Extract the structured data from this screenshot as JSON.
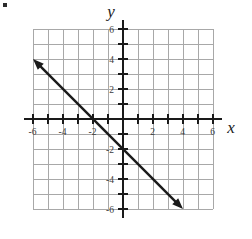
{
  "figure": {
    "name": "coordinate-plane-with-line",
    "background_color": "#ffffff",
    "width": 252,
    "height": 239
  },
  "axis_labels": {
    "x": "x",
    "y": "y"
  },
  "colors": {
    "grid": "#a8a8a8",
    "axis": "#1a1a1a",
    "line": "#1a1a1a",
    "tick_label": "#3a3a3a"
  },
  "chart_data": {
    "type": "line",
    "title": "",
    "xlabel": "x",
    "ylabel": "y",
    "xlim": [
      -6,
      6
    ],
    "ylim": [
      -6,
      6
    ],
    "grid": true,
    "legend": "none",
    "x_tick_values": [
      -6,
      -4,
      -2,
      2,
      4,
      6
    ],
    "y_tick_values": [
      6,
      4,
      2,
      -2,
      -4,
      -6
    ],
    "x_tick_labels": [
      "-6",
      "-4",
      "-2",
      "2",
      "4",
      "6"
    ],
    "y_tick_labels": [
      "6",
      "4",
      "2",
      "-2",
      "-4",
      "-6"
    ],
    "minor_tick_step": 1,
    "series": [
      {
        "name": "line",
        "equation": "y = -x - 2",
        "slope": -1,
        "y_intercept": -2,
        "x_intercept": -2,
        "arrows": "both",
        "endpoints": [
          {
            "x": -6,
            "y": 4
          },
          {
            "x": 4,
            "y": -6
          }
        ],
        "points": [
          {
            "x": -6,
            "y": 4
          },
          {
            "x": -2,
            "y": 0
          },
          {
            "x": 0,
            "y": -2
          },
          {
            "x": 4,
            "y": -6
          }
        ]
      }
    ]
  },
  "tick_label_positions": {
    "x": [
      {
        "label": "-6",
        "px": 33,
        "py": 132
      },
      {
        "label": "-4",
        "px": 63,
        "py": 132
      },
      {
        "label": "-2",
        "px": 93,
        "py": 132
      },
      {
        "label": "2",
        "px": 153,
        "py": 132
      },
      {
        "label": "4",
        "px": 183,
        "py": 132
      },
      {
        "label": "6",
        "px": 213,
        "py": 132
      }
    ],
    "y": [
      {
        "label": "6",
        "px": 113,
        "py": 29
      },
      {
        "label": "4",
        "px": 113,
        "py": 59
      },
      {
        "label": "2",
        "px": 113,
        "py": 89
      },
      {
        "label": "-2",
        "px": 113,
        "py": 149
      },
      {
        "label": "-4",
        "px": 113,
        "py": 179
      },
      {
        "label": "-6",
        "px": 113,
        "py": 209
      }
    ]
  }
}
